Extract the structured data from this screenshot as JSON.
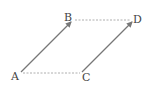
{
  "diagram": {
    "type": "parallelogram-vectors",
    "points": {
      "A": {
        "label": "A",
        "x": 20,
        "y": 73
      },
      "B": {
        "label": "B",
        "x": 73,
        "y": 19
      },
      "C": {
        "label": "C",
        "x": 82,
        "y": 73
      },
      "D": {
        "label": "D",
        "x": 134,
        "y": 19
      }
    },
    "vectors": [
      {
        "from": "A",
        "to": "B",
        "style": "solid-arrow"
      },
      {
        "from": "C",
        "to": "D",
        "style": "solid-arrow"
      }
    ],
    "segments": [
      {
        "from": "B",
        "to": "D",
        "style": "dashed"
      },
      {
        "from": "A",
        "to": "C",
        "style": "dashed"
      }
    ],
    "colors": {
      "vector": "#777777",
      "dashed": "#999999",
      "label": "#444444"
    }
  }
}
